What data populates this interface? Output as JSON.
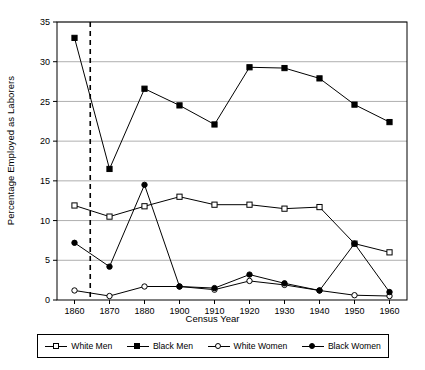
{
  "chart_data": {
    "type": "line",
    "title": "",
    "xlabel": "Census Year",
    "ylabel": "Percentage Employed as Laborers",
    "categories": [
      "1860",
      "1870",
      "1880",
      "1900",
      "1910",
      "1920",
      "1930",
      "1940",
      "1950",
      "1960"
    ],
    "ylim": [
      0,
      35
    ],
    "ytick_step": 5,
    "yticks": [
      "0",
      "5",
      "10",
      "15",
      "20",
      "25",
      "30",
      "35"
    ],
    "grid": "horizontal",
    "legend_position": "bottom",
    "annotations": [
      {
        "type": "vline",
        "style": "dashed",
        "between": [
          "1860",
          "1870"
        ],
        "position_fraction": 0.45
      }
    ],
    "series": [
      {
        "name": "White Men",
        "marker": "open-square",
        "values": [
          11.9,
          10.5,
          11.8,
          13.0,
          12.0,
          12.0,
          11.5,
          11.7,
          7.1,
          6.0
        ]
      },
      {
        "name": "Black Men",
        "marker": "filled-square",
        "values": [
          33.0,
          16.5,
          26.6,
          24.5,
          22.1,
          29.3,
          29.2,
          27.9,
          24.6,
          22.4
        ]
      },
      {
        "name": "White Women",
        "marker": "open-circle",
        "values": [
          1.2,
          0.5,
          1.7,
          1.7,
          1.3,
          2.4,
          1.9,
          1.2,
          0.6,
          0.5
        ]
      },
      {
        "name": "Black Women",
        "marker": "filled-circle",
        "values": [
          7.2,
          4.2,
          14.5,
          1.7,
          1.5,
          3.2,
          2.1,
          1.2,
          7.1,
          1.0
        ]
      }
    ]
  },
  "axis": {
    "xlabel": "Census Year",
    "ylabel": "Percentage Employed as Laborers"
  },
  "legend": {
    "items": [
      {
        "label": "White Men",
        "marker": "open-square"
      },
      {
        "label": "Black Men",
        "marker": "filled-square"
      },
      {
        "label": "White Women",
        "marker": "open-circle"
      },
      {
        "label": "Black Women",
        "marker": "filled-circle"
      }
    ]
  }
}
